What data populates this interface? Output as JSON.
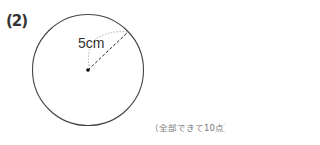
{
  "question": {
    "number_label": "(2)"
  },
  "figure": {
    "shape": "circle",
    "radius_label": "5cm",
    "center_x": 88,
    "center_y": 70,
    "radius_px": 55,
    "stroke_color": "#444444"
  },
  "score_note": "（全部できて10点）"
}
